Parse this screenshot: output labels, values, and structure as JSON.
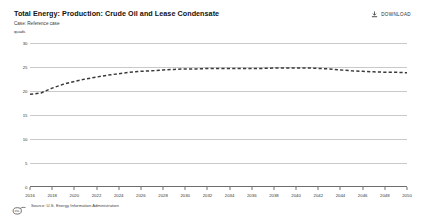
{
  "header": {
    "title": "Total Energy: Production: Crude Oil and Lease Condensate",
    "subtitle": "Case: Reference case",
    "unit": "quads"
  },
  "toolbar": {
    "download_label": "DOWNLOAD",
    "download_icon": "download-tray-icon"
  },
  "footer": {
    "source": "Source: U.S. Energy Information Administration",
    "logo": "eia-logo"
  },
  "colors": {
    "line": "#3a3a3a",
    "grid": "#c9c9c9",
    "axis": "#6e6e6e",
    "text": "#1a1a1a",
    "background": "#ffffff"
  },
  "chart_data": {
    "type": "line",
    "title": "Total Energy: Production: Crude Oil and Lease Condensate",
    "subtitle": "Case: Reference case",
    "xlabel": "",
    "ylabel": "quads",
    "ylim": [
      0,
      30
    ],
    "xlim": [
      2016,
      2050
    ],
    "yticks": [
      0,
      5,
      10,
      15,
      20,
      25,
      30
    ],
    "ytick_labels": [
      "0",
      "5",
      "10",
      "15",
      "20",
      "25",
      "30"
    ],
    "xticks": [
      2016,
      2018,
      2020,
      2022,
      2024,
      2026,
      2028,
      2030,
      2032,
      2034,
      2036,
      2038,
      2040,
      2042,
      2044,
      2046,
      2048,
      2050
    ],
    "xtick_labels": [
      "2016",
      "2018",
      "2020",
      "2022",
      "2024",
      "2026",
      "2028",
      "2030",
      "2032",
      "2034",
      "2036",
      "2038",
      "2040",
      "2042",
      "2044",
      "2046",
      "2048",
      "2050"
    ],
    "grid": "horizontal",
    "legend": "none",
    "line_style": "dashed",
    "series": [
      {
        "name": "Crude Oil and Lease Condensate",
        "x": [
          2016,
          2017,
          2018,
          2019,
          2020,
          2021,
          2022,
          2023,
          2024,
          2025,
          2026,
          2027,
          2028,
          2029,
          2030,
          2031,
          2032,
          2033,
          2034,
          2035,
          2036,
          2037,
          2038,
          2039,
          2040,
          2041,
          2042,
          2043,
          2044,
          2045,
          2046,
          2047,
          2048,
          2049,
          2050
        ],
        "values": [
          19.3,
          19.6,
          20.6,
          21.4,
          22.0,
          22.5,
          22.9,
          23.3,
          23.6,
          23.9,
          24.1,
          24.2,
          24.4,
          24.5,
          24.6,
          24.6,
          24.7,
          24.7,
          24.7,
          24.7,
          24.7,
          24.7,
          24.8,
          24.8,
          24.8,
          24.8,
          24.7,
          24.6,
          24.4,
          24.2,
          24.1,
          24.0,
          23.9,
          23.9,
          23.8
        ]
      }
    ]
  }
}
